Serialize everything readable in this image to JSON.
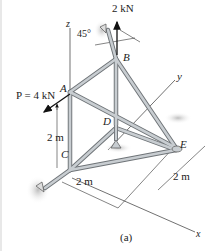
{
  "figure": {
    "caption": "(a)",
    "axes": {
      "x": "x",
      "y": "y",
      "z": "z"
    },
    "joints": {
      "A": "A",
      "B": "B",
      "C": "C",
      "D": "D",
      "E": "E"
    },
    "loads": {
      "vertical_at_B": "2 kN",
      "P": "P = 4 kN"
    },
    "angle": "45°",
    "dimensions": {
      "vertical_AC": "2 m",
      "along_x_CE": "2 m",
      "along_y": "2 m"
    },
    "colors": {
      "member": "#b9bec2",
      "member_edge": "#6f7478",
      "line": "#333333",
      "support_shadow": "#c9c9c9"
    }
  }
}
